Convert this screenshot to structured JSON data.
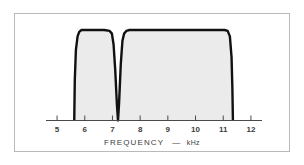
{
  "figure": {
    "background_color": "#ffffff",
    "frame_color": "#b9b9b9"
  },
  "chart_data": {
    "type": "line",
    "title": "",
    "subtitle": "",
    "xlabel": "FREQUENCY",
    "xunit": "kHz",
    "xlabel_full": "FREQUENCY — kHz",
    "ylabel": "",
    "xlim": [
      4.6,
      12.4
    ],
    "ylim": [
      0,
      1.08
    ],
    "xticks": [
      5,
      6,
      7,
      8,
      9,
      10,
      11,
      12
    ],
    "xtick_labels": [
      "5",
      "6",
      "7",
      "8",
      "9",
      "10",
      "11",
      "12"
    ],
    "yticks": [],
    "ytick_labels": [],
    "grid": false,
    "legend": false,
    "legend_position": "none",
    "series": [
      {
        "name": "filter-response",
        "line_color": "#111111",
        "line_width": 2.4,
        "fill_color": "#ebebeb",
        "x": [
          5.62,
          5.64,
          5.68,
          5.74,
          5.8,
          5.88,
          5.96,
          6.3,
          6.7,
          6.9,
          6.98,
          7.04,
          7.1,
          7.16,
          7.2,
          7.24,
          7.3,
          7.36,
          7.42,
          7.5,
          7.62,
          7.74,
          8.4,
          9.2,
          10.0,
          10.7,
          11.05,
          11.16,
          11.24,
          11.3,
          11.33,
          11.35
        ],
        "y": [
          0.0,
          0.45,
          0.78,
          0.93,
          0.98,
          1.0,
          1.0,
          1.0,
          1.0,
          0.99,
          0.96,
          0.84,
          0.56,
          0.18,
          0.0,
          0.2,
          0.62,
          0.88,
          0.96,
          0.99,
          1.0,
          1.0,
          1.0,
          1.0,
          1.0,
          1.0,
          1.0,
          0.99,
          0.93,
          0.7,
          0.36,
          0.0
        ]
      }
    ],
    "annotations": [],
    "features": {
      "passband_1": {
        "start_khz": 5.62,
        "end_khz": 7.2,
        "label": "lower passband"
      },
      "notch": {
        "center_khz": 7.2,
        "depth": 0.0,
        "label": "notch"
      },
      "passband_2": {
        "start_khz": 7.2,
        "end_khz": 11.35,
        "label": "upper passband"
      }
    }
  }
}
